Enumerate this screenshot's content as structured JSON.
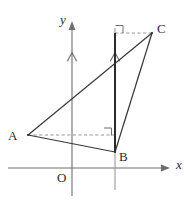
{
  "figure": {
    "kind": "geometry-diagram",
    "background_color": "#ffffff",
    "line_color": "#3a3a3a",
    "axis_color": "#6e6e6e",
    "construction_color": "#9a9a9a",
    "dash_color": "#8d8d8d"
  },
  "axes": {
    "x_axis": {
      "label": "x",
      "y": 168,
      "x_start": 8,
      "x_end": 170,
      "arrow": "right"
    },
    "y_axis": {
      "label": "y",
      "x": 72,
      "y_start": 196,
      "y_end": 22,
      "arrow": "up"
    },
    "origin_label": "O"
  },
  "points": [
    {
      "name": "A",
      "label": "A",
      "x": 28,
      "y": 135
    },
    {
      "name": "B",
      "label": "B",
      "x": 115,
      "y": 152
    },
    {
      "name": "C",
      "label": "C",
      "x": 152,
      "y": 33
    }
  ],
  "triangle": {
    "vertices": [
      "A",
      "B",
      "C"
    ],
    "edges": [
      {
        "from": "A",
        "to": "B"
      },
      {
        "from": "B",
        "to": "C"
      },
      {
        "from": "A",
        "to": "C"
      }
    ]
  },
  "vertical_line_through_B": {
    "x": 115,
    "y_top": 28,
    "y_bottom": 190
  },
  "bold_segment": {
    "from_x": 115,
    "from_y": 152,
    "to_x": 115,
    "to_y": 33
  },
  "dashed_lines": [
    {
      "name": "dash-from-A",
      "x1": 28,
      "y1": 135,
      "x2": 115,
      "y2": 135
    },
    {
      "name": "dash-to-C",
      "x1": 115,
      "y1": 33,
      "x2": 152,
      "y2": 33
    }
  ],
  "right_angle_marks": [
    {
      "name": "right-angle-at-foot-of-A",
      "x": 115,
      "y": 135,
      "open": "up-left"
    },
    {
      "name": "right-angle-at-foot-of-C",
      "x": 115,
      "y": 33,
      "open": "up-right"
    }
  ],
  "parallel_marks": [
    {
      "name": "parallel-mark-y-axis",
      "x": 72,
      "y": 57
    },
    {
      "name": "parallel-mark-vertical-B",
      "x": 115,
      "y": 57
    }
  ]
}
